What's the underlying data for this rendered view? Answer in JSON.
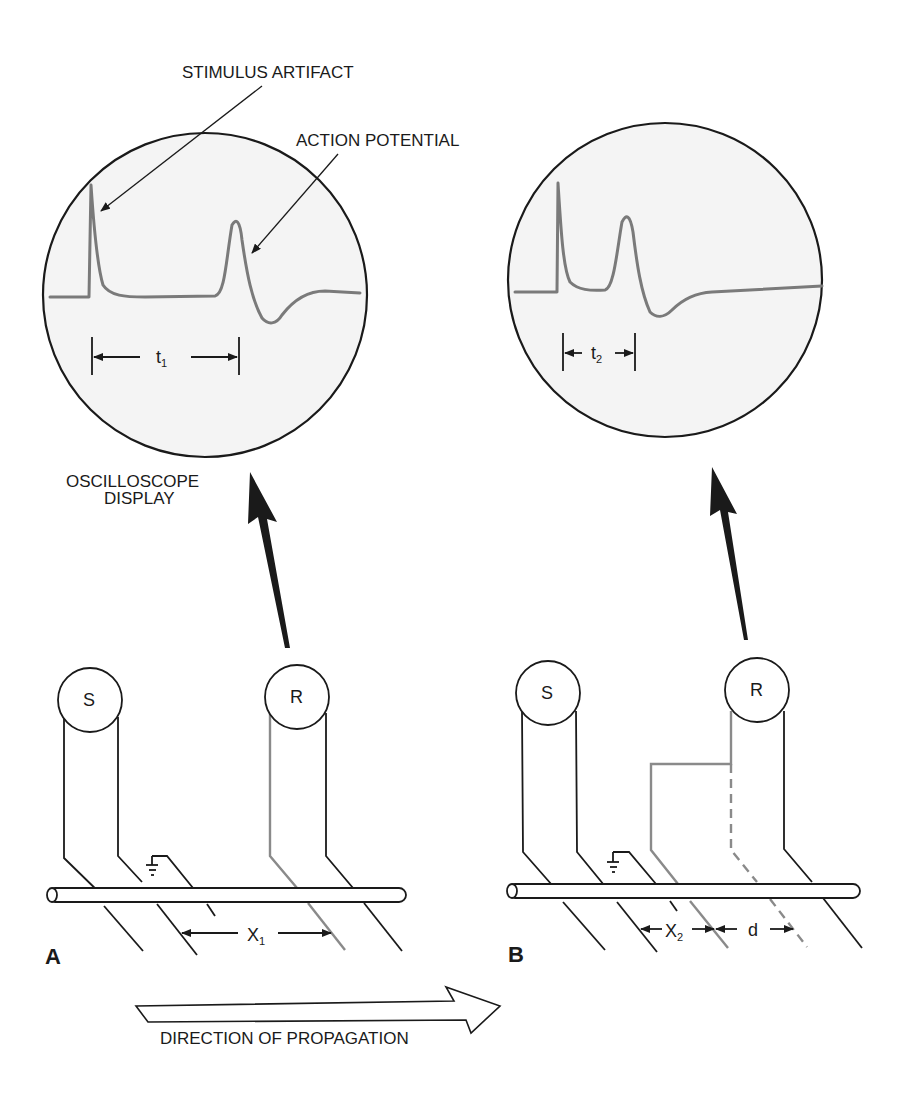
{
  "labels": {
    "stimulus_artifact": "STIMULUS ARTIFACT",
    "action_potential": "ACTION POTENTIAL",
    "oscilloscope_line1": "OSCILLOSCOPE",
    "oscilloscope_line2": "DISPLAY",
    "direction": "DIRECTION OF PROPAGATION"
  },
  "panel_a": {
    "letter": "A",
    "stim_electrode": "S",
    "rec_electrode": "R",
    "time_label": "t",
    "time_sub": "1",
    "dist_label": "X",
    "dist_sub": "1"
  },
  "panel_b": {
    "letter": "B",
    "stim_electrode": "S",
    "rec_electrode": "R",
    "time_label": "t",
    "time_sub": "2",
    "dist_label": "X",
    "dist_sub": "2",
    "offset_label": "d"
  },
  "colors": {
    "ink": "#1a1a1a",
    "trace": "#7a7a7a",
    "screen": "#f4f4f4"
  }
}
